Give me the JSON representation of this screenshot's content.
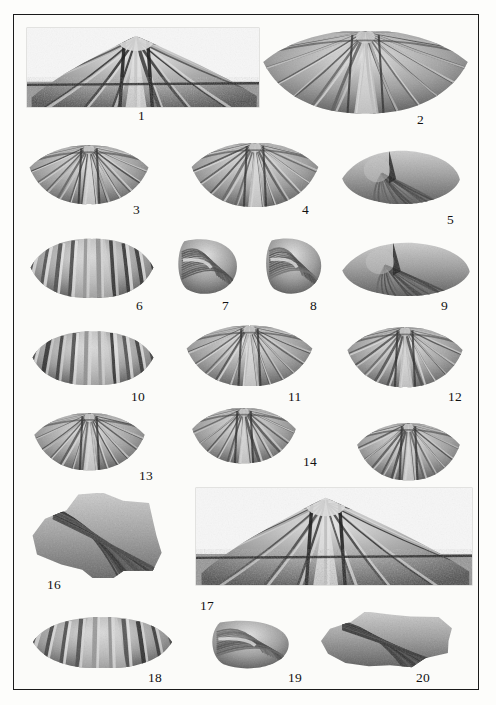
{
  "plate": {
    "background_color": "#fdfdfb",
    "frame_color": "#1a1a1a",
    "caption_color": "#111111",
    "description": "Paleontological plate of twenty numbered brachiopod fossil specimens photographed in black and white"
  },
  "figures": [
    {
      "number": "1",
      "name": "specimen-1",
      "view": "ventral-valve-in-matrix",
      "shape": "photo-block",
      "x": 27,
      "y": 28,
      "w": 232,
      "h": 79,
      "label_x": 138,
      "label_y": 109
    },
    {
      "number": "2",
      "name": "specimen-2",
      "view": "pedicle-valve",
      "shape": "winged-shell",
      "x": 259,
      "y": 26,
      "w": 213,
      "h": 90,
      "label_x": 417,
      "label_y": 113
    },
    {
      "number": "3",
      "name": "specimen-3",
      "view": "brachial-valve",
      "shape": "ribbed-shell",
      "x": 27,
      "y": 142,
      "w": 124,
      "h": 64,
      "label_x": 133,
      "label_y": 203
    },
    {
      "number": "4",
      "name": "specimen-4",
      "view": "brachial-valve",
      "shape": "ribbed-shell",
      "x": 189,
      "y": 139,
      "w": 132,
      "h": 70,
      "label_x": 302,
      "label_y": 203
    },
    {
      "number": "5",
      "name": "specimen-5",
      "view": "anterior-commissure",
      "shape": "lenticular-shell",
      "x": 341,
      "y": 145,
      "w": 120,
      "h": 62,
      "label_x": 447,
      "label_y": 213
    },
    {
      "number": "6",
      "name": "specimen-6",
      "view": "brachial-valve",
      "shape": "plicate-shell",
      "x": 28,
      "y": 235,
      "w": 128,
      "h": 65,
      "label_x": 136,
      "label_y": 299
    },
    {
      "number": "7",
      "name": "specimen-7",
      "view": "lateral-profile",
      "shape": "rounded-shell",
      "x": 175,
      "y": 235,
      "w": 66,
      "h": 63,
      "label_x": 222,
      "label_y": 299
    },
    {
      "number": "8",
      "name": "specimen-8",
      "view": "lateral-profile",
      "shape": "rounded-shell",
      "x": 263,
      "y": 234,
      "w": 62,
      "h": 64,
      "label_x": 310,
      "label_y": 299
    },
    {
      "number": "9",
      "name": "specimen-9",
      "view": "weathered-shell-in-matrix",
      "shape": "lenticular-shell",
      "x": 341,
      "y": 237,
      "w": 130,
      "h": 62,
      "label_x": 441,
      "label_y": 299
    },
    {
      "number": "10",
      "name": "specimen-10",
      "view": "anterior-view",
      "shape": "plicate-shell",
      "x": 30,
      "y": 328,
      "w": 126,
      "h": 59,
      "label_x": 131,
      "label_y": 390
    },
    {
      "number": "11",
      "name": "specimen-11",
      "view": "brachial-valve",
      "shape": "winged-shell",
      "x": 184,
      "y": 322,
      "w": 131,
      "h": 66,
      "label_x": 288,
      "label_y": 390
    },
    {
      "number": "12",
      "name": "specimen-12",
      "view": "brachial-valve",
      "shape": "winged-shell",
      "x": 345,
      "y": 324,
      "w": 120,
      "h": 65,
      "label_x": 448,
      "label_y": 390
    },
    {
      "number": "13",
      "name": "specimen-13",
      "view": "brachial-valve",
      "shape": "winged-shell",
      "x": 32,
      "y": 410,
      "w": 115,
      "h": 62,
      "label_x": 139,
      "label_y": 469
    },
    {
      "number": "14",
      "name": "specimen-14",
      "view": "brachial-valve",
      "shape": "winged-shell",
      "x": 190,
      "y": 405,
      "w": 108,
      "h": 60,
      "label_x": 303,
      "label_y": 455
    },
    {
      "number": "15",
      "name": "specimen-15",
      "view": "brachial-valve",
      "shape": "winged-shell",
      "x": 355,
      "y": 420,
      "w": 107,
      "h": 62,
      "label_x": 443,
      "label_y": 485
    },
    {
      "number": "16",
      "name": "specimen-16",
      "view": "partial-valve-fragment",
      "shape": "fragment",
      "x": 30,
      "y": 493,
      "w": 145,
      "h": 85,
      "label_x": 47,
      "label_y": 578
    },
    {
      "number": "17",
      "name": "specimen-17",
      "view": "ventral-valve-in-matrix",
      "shape": "photo-block",
      "x": 196,
      "y": 488,
      "w": 276,
      "h": 97,
      "label_x": 200,
      "label_y": 599
    },
    {
      "number": "18",
      "name": "specimen-18",
      "view": "anterior-view",
      "shape": "plicate-shell",
      "x": 30,
      "y": 614,
      "w": 145,
      "h": 56,
      "label_x": 148,
      "label_y": 671
    },
    {
      "number": "19",
      "name": "specimen-19",
      "view": "lateral-profile",
      "shape": "rounded-shell",
      "x": 208,
      "y": 617,
      "w": 86,
      "h": 55,
      "label_x": 288,
      "label_y": 671
    },
    {
      "number": "20",
      "name": "specimen-20",
      "view": "weathered-shell-in-matrix",
      "shape": "fragment",
      "x": 320,
      "y": 612,
      "w": 140,
      "h": 58,
      "label_x": 416,
      "label_y": 671
    }
  ]
}
